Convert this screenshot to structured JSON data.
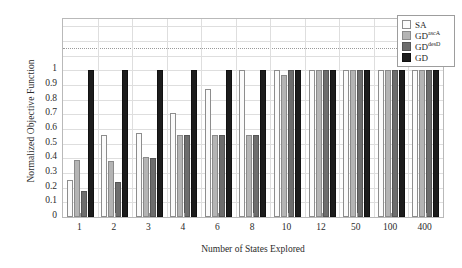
{
  "chart_data": {
    "type": "bar",
    "title": "",
    "xlabel": "Number of States Explored",
    "ylabel": "Normalized Objective Function",
    "categories": [
      "1",
      "2",
      "3",
      "4",
      "6",
      "8",
      "10",
      "12",
      "50",
      "100",
      "400"
    ],
    "ylim": [
      0,
      1.35
    ],
    "yticks": [
      "0",
      "0.1",
      "0.2",
      "0.3",
      "0.4",
      "0.5",
      "0.6",
      "0.7",
      "0.8",
      "0.9",
      "1"
    ],
    "ytick_values": [
      0,
      0.1,
      0.2,
      0.3,
      0.4,
      0.5,
      0.6,
      0.7,
      0.8,
      0.9,
      1
    ],
    "grid": true,
    "legend_position": "top-right",
    "series": [
      {
        "name": "SA",
        "color": "#fbfbfb",
        "values": [
          0.25,
          0.56,
          0.57,
          0.71,
          0.87,
          1.0,
          1.0,
          1.0,
          1.0,
          1.0,
          1.0
        ]
      },
      {
        "name": "GD_ascA",
        "color": "#b4b4b4",
        "values": [
          0.39,
          0.38,
          0.41,
          0.56,
          0.56,
          0.56,
          0.97,
          1.0,
          1.0,
          1.0,
          1.0
        ]
      },
      {
        "name": "GD_desD",
        "color": "#6d6d6d",
        "values": [
          0.18,
          0.24,
          0.4,
          0.56,
          0.56,
          0.56,
          1.0,
          1.0,
          1.0,
          1.0,
          1.0
        ]
      },
      {
        "name": "GD",
        "color": "#1c1c1c",
        "values": [
          1.0,
          1.0,
          1.0,
          1.0,
          1.0,
          1.0,
          1.0,
          1.0,
          1.0,
          1.0,
          1.0
        ]
      }
    ]
  },
  "legend": {
    "entries": [
      {
        "label": "SA",
        "sup": ""
      },
      {
        "label": "GD",
        "sup": "ascA"
      },
      {
        "label": "GD",
        "sup": "desD"
      },
      {
        "label": "GD",
        "sup": ""
      }
    ]
  }
}
